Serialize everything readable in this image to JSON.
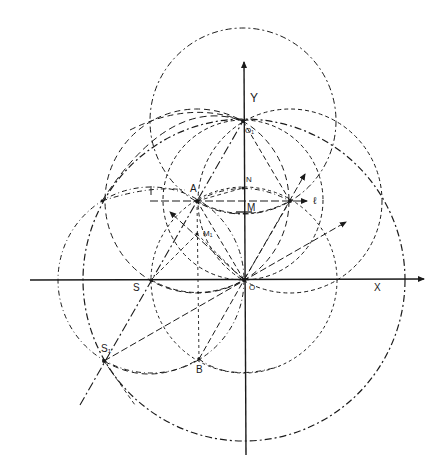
{
  "figure": {
    "title": "",
    "background": "#ffffff",
    "ink": "#1a1a1a"
  },
  "axes": {
    "x_label": "X",
    "y_label": "Y"
  },
  "points": {
    "O": {
      "label": "O",
      "x": 244,
      "y": 280
    },
    "O1": {
      "label": "O₁",
      "x": 243,
      "y": 121
    },
    "A": {
      "label": "A",
      "x": 197,
      "y": 201
    },
    "N": {
      "label": "N",
      "x": 243,
      "y": 188
    },
    "M": {
      "label": "M",
      "x": 243,
      "y": 201
    },
    "P": {
      "label": "ℓ",
      "x": 290,
      "y": 201
    },
    "M1": {
      "label": "M₁",
      "x": 197,
      "y": 234
    },
    "S": {
      "label": "S",
      "x": 151,
      "y": 280
    },
    "S1": {
      "label": "S₁",
      "x": 104,
      "y": 361
    },
    "B": {
      "label": "B",
      "x": 199,
      "y": 359
    }
  },
  "labels": {
    "Y": "Y",
    "X": "X",
    "O": "O",
    "O1": "O₁",
    "A": "A",
    "N": "N",
    "M": "M",
    "l": "ℓ",
    "M1": "M₁",
    "S": "S",
    "S1": "S₁",
    "B": "B"
  },
  "circles": [
    {
      "name": "circle-center-O1",
      "cx": 243,
      "cy": 121,
      "r": 93,
      "dash": "6 3 2 3"
    },
    {
      "name": "circle-center-O-large",
      "cx": 244,
      "cy": 280,
      "r": 161,
      "dash": "7 3 2 3"
    },
    {
      "name": "circle-center-O-small",
      "cx": 244,
      "cy": 280,
      "r": 93,
      "dash": "3 3"
    },
    {
      "name": "circle-center-A",
      "cx": 197,
      "cy": 201,
      "r": 92,
      "dash": "6 4"
    },
    {
      "name": "circle-center-P",
      "cx": 290,
      "cy": 201,
      "r": 92,
      "dash": "4 3"
    },
    {
      "name": "circle-center-S",
      "cx": 151,
      "cy": 280,
      "r": 93,
      "dash": "5 3 1 3"
    },
    {
      "name": "circle-diameter-OO1",
      "cx": 243,
      "cy": 200,
      "r": 80,
      "dash": "4 3"
    }
  ]
}
